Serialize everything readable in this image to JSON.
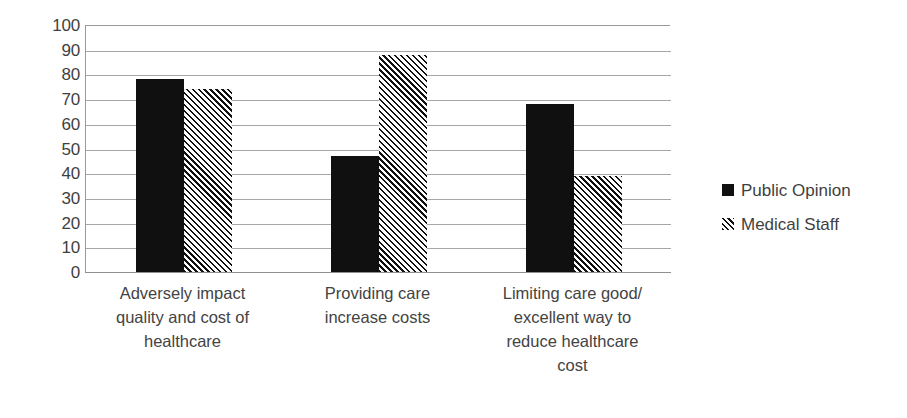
{
  "chart_data": {
    "type": "bar",
    "title": "",
    "subtitle": "",
    "xlabel": "",
    "ylabel": "",
    "ylim": [
      0,
      100
    ],
    "ytick_step": 10,
    "yticks": [
      "100",
      "90",
      "80",
      "70",
      "60",
      "50",
      "40",
      "30",
      "20",
      "10",
      "0"
    ],
    "grid": true,
    "legend_position": "right",
    "categories": [
      "Adversely impact quality and cost of healthcare",
      "Providing care increase costs",
      "Limiting care good/ excellent way to reduce healthcare cost"
    ],
    "category_lines": [
      [
        "Adversely impact",
        "quality and cost of",
        "healthcare"
      ],
      [
        "Providing care",
        "increase costs"
      ],
      [
        "Limiting care good/",
        "excellent way to",
        "reduce healthcare",
        "cost"
      ]
    ],
    "series": [
      {
        "name": "Public Opinion",
        "fill": "solid",
        "color": "#101010",
        "values": [
          78,
          47,
          68
        ]
      },
      {
        "name": "Medical Staff",
        "fill": "hatched",
        "color": "#111111",
        "values": [
          74,
          88,
          39
        ]
      }
    ]
  },
  "legend": {
    "items": [
      {
        "label": "Public Opinion",
        "swatch": "solid-square-icon"
      },
      {
        "label": "Medical Staff",
        "swatch": "hatched-square-icon"
      }
    ]
  },
  "axis": {
    "y_labels": [
      "100",
      "90",
      "80",
      "70",
      "60",
      "50",
      "40",
      "30",
      "20",
      "10",
      "0"
    ]
  }
}
